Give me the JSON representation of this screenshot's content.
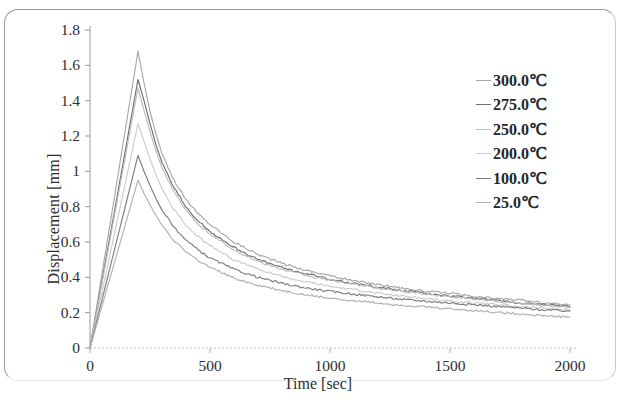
{
  "chart_data": {
    "type": "line",
    "title": "",
    "xlabel": "Time [sec]",
    "ylabel": "Displacement [mm]",
    "xlim": [
      0,
      2000
    ],
    "ylim": [
      0,
      1.8
    ],
    "xticks": [
      "0",
      "500",
      "1000",
      "1500",
      "2000"
    ],
    "yticks": [
      "0",
      "0.2",
      "0.4",
      "0.6",
      "0.8",
      "1",
      "1.2",
      "1.4",
      "1.6",
      "1.8"
    ],
    "grid": false,
    "legend_position": "right",
    "x": [
      0,
      25,
      50,
      75,
      100,
      125,
      150,
      175,
      200,
      225,
      250,
      275,
      300,
      350,
      400,
      450,
      500,
      600,
      700,
      800,
      900,
      1000,
      1100,
      1200,
      1300,
      1400,
      1500,
      1600,
      1700,
      1800,
      1900,
      2000
    ],
    "series": [
      {
        "name": "300.0℃",
        "color": "#a7a7a7",
        "peak_time": 200,
        "peak_value": 1.68,
        "values": [
          0,
          0.21,
          0.42,
          0.63,
          0.84,
          1.05,
          1.26,
          1.47,
          1.68,
          1.5,
          1.34,
          1.21,
          1.1,
          0.95,
          0.84,
          0.76,
          0.7,
          0.6,
          0.53,
          0.48,
          0.44,
          0.41,
          0.38,
          0.36,
          0.34,
          0.32,
          0.31,
          0.29,
          0.28,
          0.27,
          0.255,
          0.245
        ]
      },
      {
        "name": "275.0℃",
        "color": "#6f6f6f",
        "peak_time": 200,
        "peak_value": 1.52,
        "values": [
          0,
          0.19,
          0.38,
          0.57,
          0.76,
          0.95,
          1.14,
          1.33,
          1.52,
          1.4,
          1.27,
          1.15,
          1.05,
          0.91,
          0.8,
          0.72,
          0.66,
          0.57,
          0.5,
          0.455,
          0.42,
          0.39,
          0.365,
          0.345,
          0.325,
          0.31,
          0.295,
          0.28,
          0.27,
          0.255,
          0.245,
          0.235
        ]
      },
      {
        "name": "250.0℃",
        "color": "#bcbcbc",
        "peak_time": 200,
        "peak_value": 1.47,
        "values": [
          0,
          0.184,
          0.368,
          0.551,
          0.735,
          0.919,
          1.1,
          1.29,
          1.47,
          1.345,
          1.225,
          1.115,
          1.02,
          0.885,
          0.78,
          0.705,
          0.645,
          0.555,
          0.49,
          0.445,
          0.41,
          0.385,
          0.36,
          0.34,
          0.32,
          0.305,
          0.29,
          0.275,
          0.265,
          0.25,
          0.24,
          0.23
        ]
      },
      {
        "name": "200.0℃",
        "color": "#cbcbcb",
        "peak_time": 200,
        "peak_value": 1.27,
        "values": [
          0,
          0.159,
          0.318,
          0.476,
          0.635,
          0.794,
          0.953,
          1.11,
          1.27,
          1.17,
          1.07,
          0.98,
          0.9,
          0.785,
          0.695,
          0.63,
          0.58,
          0.5,
          0.445,
          0.405,
          0.375,
          0.35,
          0.33,
          0.31,
          0.295,
          0.28,
          0.265,
          0.255,
          0.245,
          0.235,
          0.225,
          0.215
        ]
      },
      {
        "name": "100.0℃",
        "color": "#7d7d7d",
        "peak_time": 200,
        "peak_value": 1.09,
        "values": [
          0,
          0.136,
          0.273,
          0.409,
          0.545,
          0.681,
          0.818,
          0.954,
          1.09,
          1.0,
          0.92,
          0.845,
          0.78,
          0.685,
          0.61,
          0.555,
          0.51,
          0.445,
          0.4,
          0.365,
          0.34,
          0.32,
          0.305,
          0.29,
          0.275,
          0.265,
          0.255,
          0.245,
          0.235,
          0.225,
          0.215,
          0.21
        ]
      },
      {
        "name": "25.0℃",
        "color": "#b0b0b0",
        "peak_time": 200,
        "peak_value": 0.95,
        "values": [
          0,
          0.119,
          0.238,
          0.356,
          0.475,
          0.594,
          0.713,
          0.831,
          0.95,
          0.875,
          0.81,
          0.75,
          0.695,
          0.61,
          0.545,
          0.495,
          0.455,
          0.395,
          0.355,
          0.325,
          0.3,
          0.282,
          0.268,
          0.255,
          0.243,
          0.232,
          0.222,
          0.212,
          0.202,
          0.192,
          0.182,
          0.175
        ]
      }
    ]
  }
}
